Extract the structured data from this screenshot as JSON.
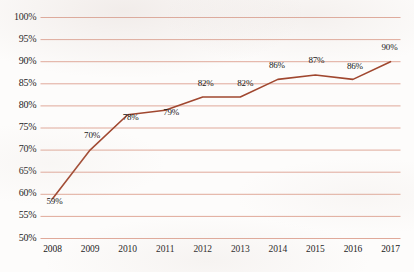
{
  "chart_data": {
    "type": "line",
    "title": "",
    "subtitle": "",
    "xlabel": "",
    "ylabel": "",
    "categories": [
      "2008",
      "2009",
      "2010",
      "2011",
      "2012",
      "2013",
      "2014",
      "2015",
      "2016",
      "2017"
    ],
    "values": [
      59,
      70,
      78,
      79,
      82,
      82,
      86,
      87,
      86,
      90
    ],
    "data_labels": [
      "59%",
      "70%",
      "78%",
      "79%",
      "82%",
      "82%",
      "86%",
      "87%",
      "86%",
      "90%"
    ],
    "ylim": [
      50,
      100
    ],
    "ytick_values": [
      50,
      55,
      60,
      65,
      70,
      75,
      80,
      85,
      90,
      95,
      100
    ],
    "ytick_labels": [
      "50%",
      "55%",
      "60%",
      "65%",
      "70%",
      "75%",
      "80%",
      "85%",
      "90%",
      "95%",
      "100%"
    ],
    "ytick_step": 5,
    "grid": true,
    "grid_axis": "y",
    "legend": false,
    "legend_position": "none",
    "markers": false,
    "series": [
      {
        "name": "",
        "values": [
          59,
          70,
          78,
          79,
          82,
          82,
          86,
          87,
          86,
          90
        ]
      }
    ]
  },
  "style": {
    "line_color": "#A0472F",
    "grid_color": "#E0A99A",
    "axis_color": "#C98371",
    "text_color": "#1a1a1a",
    "background": "#fdfcfb"
  },
  "label_offsets": [
    {
      "dx": 2,
      "dy": -3
    },
    {
      "dx": 2,
      "dy": -20
    },
    {
      "dx": 3,
      "dy": -3
    },
    {
      "dx": 6,
      "dy": -3
    },
    {
      "dx": 3,
      "dy": -19
    },
    {
      "dx": 5,
      "dy": -19
    },
    {
      "dx": -1,
      "dy": -19
    },
    {
      "dx": 1,
      "dy": -20
    },
    {
      "dx": 2,
      "dy": -18
    },
    {
      "dx": -1,
      "dy": -20
    }
  ]
}
